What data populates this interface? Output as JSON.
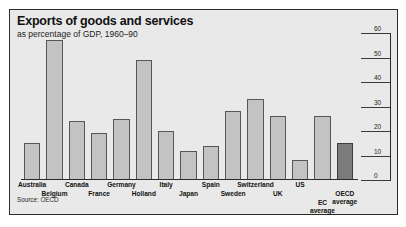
{
  "figure": {
    "title": "Exports of goods and services",
    "subtitle": "as percentage of GDP, 1960–90",
    "source": "Source: OECD"
  },
  "colors": {
    "panel": "#e9e9e9",
    "bar": "#c3c3c3",
    "bar_border": "#575757",
    "accent_bar": "#7b7b7b",
    "frame": "#2b2b2b",
    "text": "#111111"
  },
  "chart_data": {
    "type": "bar",
    "title": "Exports of goods and services",
    "subtitle": "as percentage of GDP, 1960–90",
    "xlabel": "",
    "ylabel": "",
    "ylim": [
      0,
      60
    ],
    "yticks": [
      0,
      10,
      20,
      30,
      40,
      50,
      60
    ],
    "ytick_labels": [
      "0",
      "10",
      "20",
      "30",
      "40",
      "50",
      "60"
    ],
    "axis_position": "right",
    "grid": false,
    "legend": "none",
    "source": "Source: OECD",
    "categories": [
      "Australia",
      "Belgium",
      "Canada",
      "France",
      "Germany",
      "Holland",
      "Italy",
      "Japan",
      "Spain",
      "Sweden",
      "Switzerland",
      "UK",
      "US",
      "EC average",
      "OECD average"
    ],
    "category_label_rows": [
      0,
      1,
      0,
      1,
      0,
      1,
      0,
      1,
      0,
      1,
      0,
      1,
      0,
      2,
      1
    ],
    "values": [
      15,
      57,
      24,
      19,
      25,
      49,
      20,
      12,
      14,
      28,
      33,
      26,
      8,
      26,
      15
    ],
    "highlight_index": 14
  }
}
